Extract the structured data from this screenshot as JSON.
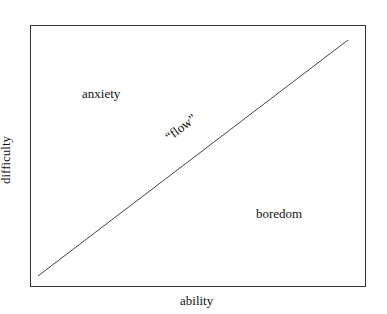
{
  "diagram": {
    "x_axis_label": "ability",
    "y_axis_label": "difficulty",
    "regions": [
      {
        "name": "anxiety",
        "label": "anxiety"
      },
      {
        "name": "flow",
        "label": "“flow”"
      },
      {
        "name": "boredom",
        "label": "boredom"
      }
    ],
    "line": {
      "from": [
        38,
        276
      ],
      "to": [
        348,
        40
      ],
      "color": "#333333"
    }
  }
}
